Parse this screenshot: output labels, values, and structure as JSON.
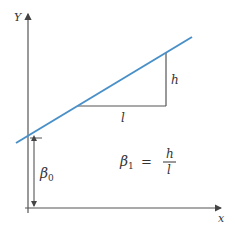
{
  "diagram": {
    "type": "linear-regression-slope-intercept",
    "axes": {
      "y_label": "Y",
      "x_label": "x"
    },
    "line": {
      "color": "#4a90c8",
      "x1": 16,
      "y1": 143,
      "x2": 192,
      "y2": 37
    },
    "triangle": {
      "run_label": "l",
      "rise_label": "h"
    },
    "intercept": {
      "label": "β",
      "subscript": "0"
    },
    "formula": {
      "lhs": "β",
      "lhs_subscript": "1",
      "equals": "=",
      "numerator": "h",
      "denominator": "l"
    },
    "colors": {
      "axis": "#555555",
      "line": "#4a90c8",
      "text": "#333333"
    }
  }
}
